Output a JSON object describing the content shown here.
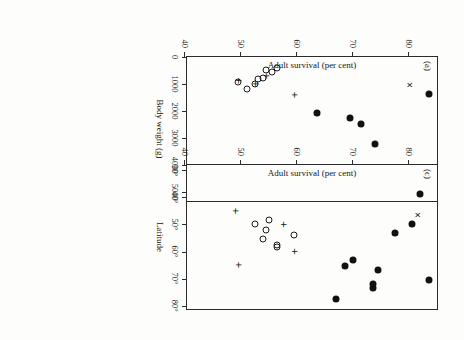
{
  "figure": {
    "background_color": "#fdfdfb",
    "ink_color": "#141414",
    "rotation_note": "scan rotated 90 degrees"
  },
  "chart_data": [
    {
      "type": "scatter",
      "panel_label": "(a)",
      "title": "",
      "xlabel": "Body weight (g)",
      "ylabel": "Adult survival (per cent)",
      "xlim": [
        0,
        5400
      ],
      "ylim": [
        40,
        85
      ],
      "xticks": [
        0,
        1000,
        2000,
        3000,
        4000,
        5000
      ],
      "xticklabels": [
        "0",
        "1000",
        "2000",
        "3000",
        "4000",
        "5000"
      ],
      "yticks": [
        40,
        50,
        60,
        70,
        80
      ],
      "yticklabels": [
        "40",
        "50",
        "60",
        "70",
        "80"
      ],
      "grid": false,
      "legend": "none",
      "series": [
        {
          "name": "filled-circle",
          "marker": "filled circle",
          "points": [
            {
              "x": 1380,
              "y": 83.5
            },
            {
              "x": 5080,
              "y": 82.0
            },
            {
              "x": 3220,
              "y": 74.0
            },
            {
              "x": 2480,
              "y": 71.5
            },
            {
              "x": 2240,
              "y": 69.5
            },
            {
              "x": 2080,
              "y": 63.5
            }
          ]
        },
        {
          "name": "open-circle",
          "marker": "open circle",
          "points": [
            {
              "x": 1180,
              "y": 51.0
            },
            {
              "x": 1010,
              "y": 52.5
            },
            {
              "x": 820,
              "y": 53.0
            },
            {
              "x": 760,
              "y": 54.0
            },
            {
              "x": 560,
              "y": 55.5
            },
            {
              "x": 480,
              "y": 54.5
            },
            {
              "x": 400,
              "y": 56.5
            },
            {
              "x": 930,
              "y": 49.5
            }
          ]
        },
        {
          "name": "plus",
          "marker": "plus",
          "points": [
            {
              "x": 1400,
              "y": 59.5
            },
            {
              "x": 1000,
              "y": 52.5
            },
            {
              "x": 700,
              "y": 54.5
            },
            {
              "x": 880,
              "y": 49.5
            }
          ]
        },
        {
          "name": "cross",
          "marker": "x",
          "points": [
            {
              "x": 1030,
              "y": 80.0
            }
          ]
        }
      ]
    },
    {
      "type": "scatter",
      "panel_label": "(c)",
      "title": "",
      "xlabel": "Latitude",
      "ylabel": "Adult survival (per cent)",
      "xlim": [
        28,
        82
      ],
      "ylim": [
        40,
        85
      ],
      "xticks": [
        30,
        40,
        50,
        60,
        70,
        80
      ],
      "xticklabels": [
        "30°",
        "40°",
        "50°",
        "60°",
        "70°",
        "80°"
      ],
      "yticks": [
        40,
        50,
        60,
        70,
        80
      ],
      "yticklabels": [
        "40",
        "50",
        "60",
        "70",
        "80"
      ],
      "grid": false,
      "legend": "none",
      "series": [
        {
          "name": "filled-circle",
          "marker": "filled circle",
          "points": [
            {
              "x": 70.5,
              "y": 83.5
            },
            {
              "x": 73.5,
              "y": 73.5
            },
            {
              "x": 72.0,
              "y": 73.5
            },
            {
              "x": 67.0,
              "y": 74.5
            },
            {
              "x": 63.0,
              "y": 70.0
            },
            {
              "x": 65.5,
              "y": 68.5
            },
            {
              "x": 77.5,
              "y": 67.0
            },
            {
              "x": 53.0,
              "y": 77.5
            },
            {
              "x": 50.0,
              "y": 80.5
            }
          ]
        },
        {
          "name": "open-circle",
          "marker": "open circle",
          "points": [
            {
              "x": 58.5,
              "y": 56.5
            },
            {
              "x": 57.5,
              "y": 56.5
            },
            {
              "x": 55.5,
              "y": 54.0
            },
            {
              "x": 54.0,
              "y": 59.5
            },
            {
              "x": 48.5,
              "y": 55.0
            },
            {
              "x": 52.0,
              "y": 54.5
            },
            {
              "x": 50.0,
              "y": 52.5
            }
          ]
        },
        {
          "name": "plus",
          "marker": "plus",
          "points": [
            {
              "x": 65.0,
              "y": 49.5
            },
            {
              "x": 60.0,
              "y": 59.5
            },
            {
              "x": 50.0,
              "y": 57.5
            },
            {
              "x": 45.0,
              "y": 49.0
            }
          ]
        },
        {
          "name": "cross",
          "marker": "x",
          "points": [
            {
              "x": 46.5,
              "y": 81.5
            }
          ]
        }
      ]
    }
  ]
}
